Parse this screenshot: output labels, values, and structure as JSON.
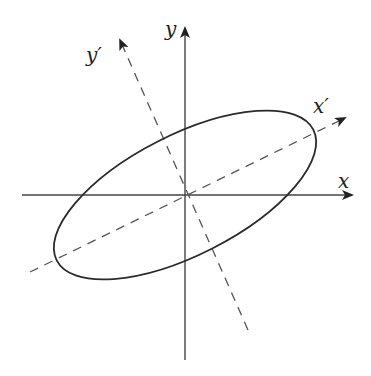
{
  "diagram": {
    "colors": {
      "axis": "#444444",
      "ellipse": "#2a2a2a",
      "dashed": "#555555",
      "background": "#ffffff"
    },
    "labels": {
      "x": "x",
      "y": "y",
      "x_prime": "x′",
      "y_prime": "y′"
    },
    "axes": [
      {
        "name": "x",
        "style": "solid",
        "from": [
          22,
          195
        ],
        "to": [
          352,
          195
        ]
      },
      {
        "name": "y",
        "style": "solid",
        "from": [
          185,
          360
        ],
        "to": [
          185,
          28
        ]
      },
      {
        "name": "x_prime",
        "style": "dashed",
        "from": [
          30,
          272
        ],
        "to": [
          345,
          118
        ]
      },
      {
        "name": "y_prime",
        "style": "dashed",
        "from": [
          248,
          330
        ],
        "to": [
          120,
          40
        ]
      }
    ],
    "ellipse": {
      "center": [
        185,
        195
      ],
      "rx": 144,
      "ry": 60,
      "rotation_deg": -27
    }
  }
}
